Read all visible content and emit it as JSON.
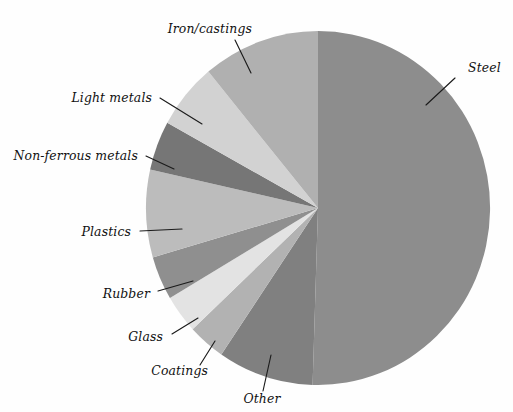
{
  "chart_data": {
    "type": "pie",
    "title": "",
    "subtitle": "",
    "xlabel": "",
    "ylabel": "",
    "legend_position": "none",
    "grid": false,
    "labels_placement": "outside-with-leader-lines",
    "start_angle_deg": 0,
    "direction": "clockwise",
    "categories": [
      "Steel",
      "Other",
      "Coatings",
      "Glass",
      "Rubber",
      "Plastics",
      "Non-ferrous metals",
      "Light metals",
      "Iron/castings"
    ],
    "values": [
      50.5,
      9.0,
      3.5,
      3.5,
      4.0,
      8.0,
      4.5,
      6.0,
      11.0
    ],
    "units": "percent",
    "slices": [
      {
        "label": "Steel",
        "value": 50.5,
        "start_deg": 0,
        "end_deg": 181.8,
        "color": "#8d8d8d",
        "label_x": 468,
        "label_y": 72,
        "anchor": "start",
        "leader": "426,105 455,78"
      },
      {
        "label": "Other",
        "value": 9.0,
        "start_deg": 181.8,
        "end_deg": 214.2,
        "color": "#808080",
        "label_x": 262,
        "label_y": 403,
        "anchor": "middle",
        "leader": "271,355 263,391"
      },
      {
        "label": "Coatings",
        "value": 3.5,
        "start_deg": 214.2,
        "end_deg": 226.8,
        "color": "#b2b2b2",
        "label_x": 208,
        "label_y": 375,
        "anchor": "end",
        "leader": "215,341 200,365"
      },
      {
        "label": "Glass",
        "value": 3.5,
        "start_deg": 226.8,
        "end_deg": 239.4,
        "color": "#e3e3e3",
        "label_x": 163,
        "label_y": 341,
        "anchor": "end",
        "leader": "198,318 172,334"
      },
      {
        "label": "Rubber",
        "value": 4.0,
        "start_deg": 239.4,
        "end_deg": 253.8,
        "color": "#8f8f8f",
        "label_x": 150,
        "label_y": 298,
        "anchor": "end",
        "leader": "193,281 158,291"
      },
      {
        "label": "Plastics",
        "value": 8.0,
        "start_deg": 253.8,
        "end_deg": 282.6,
        "color": "#bcbcbc",
        "label_x": 131,
        "label_y": 236,
        "anchor": "end",
        "leader": "182,229 140,231"
      },
      {
        "label": "Non-ferrous metals",
        "value": 4.5,
        "start_deg": 282.6,
        "end_deg": 298.8,
        "color": "#767676",
        "label_x": 138,
        "label_y": 160,
        "anchor": "end",
        "leader": "174,169 146,156"
      },
      {
        "label": "Light metals",
        "value": 6.0,
        "start_deg": 298.8,
        "end_deg": 320.4,
        "color": "#d2d2d2",
        "label_x": 152,
        "label_y": 102,
        "anchor": "end",
        "leader": "202,124 160,98"
      },
      {
        "label": "Iron/castings",
        "value": 11.0,
        "start_deg": 320.4,
        "end_deg": 360,
        "color": "#b0b0b0",
        "label_x": 252,
        "label_y": 33,
        "anchor": "end",
        "leader": "251,73 235,40"
      }
    ],
    "geometry": {
      "center_x": 318,
      "center_y": 208,
      "radius_x": 172,
      "radius_y": 177
    },
    "colors": {
      "steel": "#8d8d8d",
      "other": "#808080",
      "coatings": "#b2b2b2",
      "glass": "#e3e3e3",
      "rubber": "#8f8f8f",
      "plastics": "#bcbcbc",
      "non_ferrous_metals": "#767676",
      "light_metals": "#d2d2d2",
      "iron_castings": "#b0b0b0",
      "background": "#fefefe",
      "label_text": "#111111",
      "leader_line": "#1b1b1b"
    }
  }
}
